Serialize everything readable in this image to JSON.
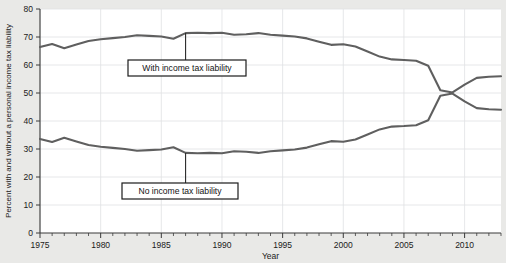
{
  "chart_data": {
    "type": "line",
    "title": "",
    "xlabel": "Year",
    "ylabel": "Percent with and without a personal income tax liability",
    "xlim": [
      1975,
      2013
    ],
    "ylim": [
      0,
      80
    ],
    "grid": true,
    "legend_position": "inline-annotations",
    "y_ticks": [
      0,
      10,
      20,
      30,
      40,
      50,
      60,
      70,
      80
    ],
    "x_ticks_labeled": [
      1975,
      1980,
      1985,
      1990,
      1995,
      2000,
      2005,
      2010
    ],
    "x_minor_tick_interval": 1,
    "x": [
      1975,
      1976,
      1977,
      1978,
      1979,
      1980,
      1981,
      1982,
      1983,
      1984,
      1985,
      1986,
      1987,
      1988,
      1989,
      1990,
      1991,
      1992,
      1993,
      1994,
      1995,
      1996,
      1997,
      1998,
      1999,
      2000,
      2001,
      2002,
      2003,
      2004,
      2005,
      2006,
      2007,
      2008,
      2009,
      2010,
      2011,
      2012,
      2013
    ],
    "series": [
      {
        "name": "With income tax liability",
        "color": "#5f5f5f",
        "values": [
          66.4,
          67.5,
          66.0,
          67.3,
          68.6,
          69.2,
          69.6,
          70.0,
          70.6,
          70.4,
          70.2,
          69.4,
          71.4,
          71.5,
          71.4,
          71.5,
          70.8,
          71.0,
          71.4,
          70.8,
          70.5,
          70.2,
          69.5,
          68.3,
          67.2,
          67.4,
          66.6,
          64.8,
          63.0,
          62.0,
          61.8,
          61.5,
          59.7,
          51.0,
          50.2,
          53.0,
          55.4,
          55.8,
          56.0
        ]
      },
      {
        "name": "No income tax liability",
        "color": "#5f5f5f",
        "values": [
          33.6,
          32.5,
          34.0,
          32.7,
          31.4,
          30.8,
          30.4,
          30.0,
          29.4,
          29.6,
          29.8,
          30.6,
          28.6,
          28.5,
          28.6,
          28.5,
          29.2,
          29.0,
          28.6,
          29.2,
          29.5,
          29.8,
          30.5,
          31.7,
          32.8,
          32.6,
          33.4,
          35.2,
          37.0,
          38.0,
          38.2,
          38.5,
          40.3,
          49.0,
          49.8,
          47.0,
          44.6,
          44.2,
          44.0
        ]
      }
    ],
    "annotations": [
      {
        "label": "With income tax liability",
        "anchor_year": 1987,
        "anchor_value": 71.4
      },
      {
        "label": "No income tax liability",
        "anchor_year": 1987,
        "anchor_value": 28.6
      }
    ]
  }
}
